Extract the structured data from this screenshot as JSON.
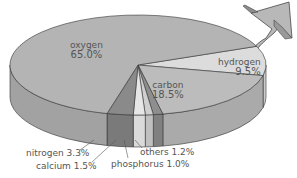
{
  "chart_data": {
    "type": "pie",
    "style": "3d-pie-with-male-symbol-arrow",
    "title": "",
    "slices": [
      {
        "name": "oxygen",
        "value": 65.0,
        "label": "oxygen",
        "pct": "65.0%",
        "top": "#b4b4b4",
        "side": "#a2a2a2"
      },
      {
        "name": "carbon",
        "value": 18.5,
        "label": "carbon",
        "pct": "18.5%",
        "top": "#bcbcbc",
        "side": "#aaaaaa"
      },
      {
        "name": "hydrogen",
        "value": 9.5,
        "label": "hydrogen",
        "pct": "9.5%",
        "top": "#dcdcdc",
        "side": "#cccccc"
      },
      {
        "name": "nitrogen",
        "value": 3.3,
        "label": "nitrogen 3.3%",
        "top": "#8a8a8a",
        "side": "#7a7a7a"
      },
      {
        "name": "calcium",
        "value": 1.5,
        "label": "calcium 1.5%",
        "top": "#e6e6e6",
        "side": "#dadada"
      },
      {
        "name": "phosphorus",
        "value": 1.0,
        "label": "phosphorus 1.0%",
        "top": "#cfcfcf",
        "side": "#c0c0c0"
      },
      {
        "name": "others",
        "value": 1.2,
        "label": "others 1.2%",
        "top": "#8e8e8e",
        "side": "#808080"
      }
    ]
  },
  "labels": {
    "oxygen_name": "oxygen",
    "oxygen_pct": "65.0%",
    "carbon_name": "carbon",
    "carbon_pct": "18.5%",
    "hydrogen_name": "hydrogen",
    "hydrogen_pct": "9.5%",
    "nitrogen": "nitrogen 3.3%",
    "calcium": "calcium 1.5%",
    "phosphorus": "phosphorus 1.0%",
    "others": "others 1.2%"
  }
}
